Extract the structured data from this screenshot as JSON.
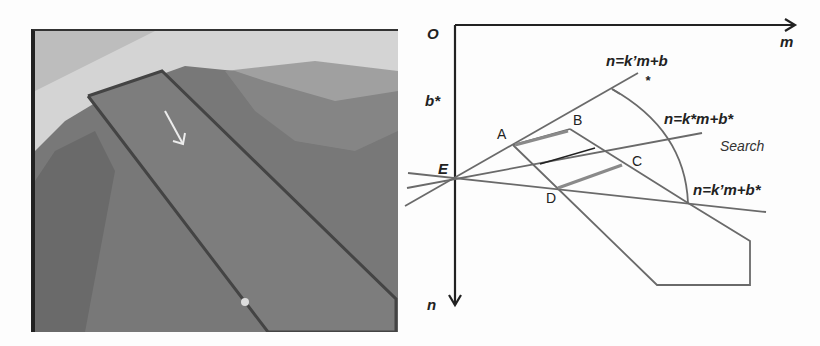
{
  "photo": {
    "description": "aerial grayscale photo of a rectangular search region outlined on a river bank with a white arrow",
    "colors": {
      "water": "#d9d9d9",
      "bank": "#7a7a7a",
      "outline": "#444444",
      "arrow": "#e8e8e8"
    }
  },
  "diagram": {
    "origin_label": "O",
    "x_axis_label": "m",
    "y_axis_label": "n",
    "intercept_label": "b*",
    "point_E": "E",
    "points": {
      "A": "A",
      "B": "B",
      "C": "C",
      "D": "D"
    },
    "lines": {
      "upper": "n=k’m+b",
      "upper_star": "*",
      "middle": "n=k*m+b*",
      "lower": "n=k’m+b*"
    },
    "region_label": "Search",
    "colors": {
      "axis": "#222222",
      "line": "#6a6a6a",
      "highlight": "#8a8a8a",
      "text": "#222222"
    }
  }
}
